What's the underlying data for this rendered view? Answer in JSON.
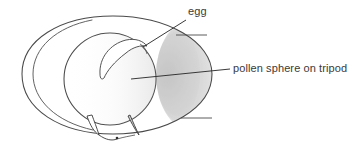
{
  "figure": {
    "kind": "hand-drawn-biology-diagram",
    "background_color": "#ffffff",
    "ink_color": "#4a4a4a",
    "dark_ink_color": "#2e2e2e",
    "shade_color": "#b4b4b4",
    "text_color": "#3a3a3a"
  },
  "labels": {
    "egg": {
      "text": "egg",
      "x": 188,
      "y": 5,
      "leader": {
        "from_x": 186,
        "from_y": 20,
        "to_x": 143,
        "to_y": 47
      }
    },
    "pollen": {
      "text": "pollen sphere on tripod",
      "x": 233,
      "y": 62,
      "leader": {
        "from_x": 230,
        "from_y": 69,
        "to_x": 131,
        "to_y": 79
      }
    }
  },
  "parts": {
    "outer_wall": "outer-ellipse-outline",
    "inner_wall": "inner-crescent-arc",
    "sphere": "pollen-sphere-circle",
    "egg_shape": "egg-crescent",
    "tripod_left": "tripod-leg-left",
    "tripod_right": "tripod-leg-right",
    "shading": "right-side-shading",
    "tick_upper": "upper-tick-line",
    "tick_lower": "lower-tick-line"
  }
}
